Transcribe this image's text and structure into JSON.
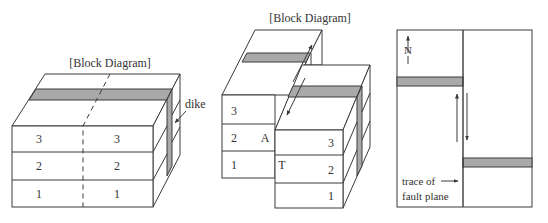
{
  "colors": {
    "line": "#3a3a3a",
    "dike_fill": "#a9a9a9",
    "face": "#ffffff",
    "text": "#333333"
  },
  "panel_left": {
    "title": "[Block Diagram]",
    "dike_label": "dike",
    "layers_left": [
      "3",
      "2",
      "1"
    ],
    "layers_right": [
      "3",
      "2",
      "1"
    ]
  },
  "panel_middle": {
    "title": "[Block Diagram]",
    "left_block_layers": [
      "3",
      "2",
      "1"
    ],
    "right_block_layers": [
      "3",
      "2",
      "1"
    ],
    "point_a": "A",
    "point_t": "T"
  },
  "panel_right": {
    "north_label": "N",
    "trace_label_line1": "trace of",
    "trace_label_line2": "fault plane"
  }
}
